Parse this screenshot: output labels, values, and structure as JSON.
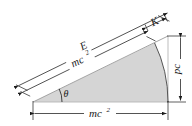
{
  "figure": {
    "background_color": "#ffffff",
    "fill_color": "#d5d5d5",
    "line_color": "#1a1a1a",
    "arc_color": "#555555"
  },
  "labels": {
    "total_energy": {
      "text": "E",
      "name": "total-energy-label"
    },
    "rest_energy_diagonal": {
      "base": "mc",
      "exponent": "2",
      "name": "rest-energy-diagonal-label"
    },
    "kinetic_energy": {
      "text": "K",
      "name": "kinetic-energy-label"
    },
    "momentum_term": {
      "text": "pc",
      "name": "momentum-term-label"
    },
    "rest_energy_base": {
      "base": "mc",
      "exponent": "2",
      "name": "rest-energy-base-label"
    },
    "angle": {
      "text": "θ",
      "name": "angle-theta-label"
    }
  },
  "geometry": {
    "apex": {
      "x": 33,
      "y": 102
    },
    "base_right": {
      "x": 168,
      "y": 102
    },
    "top_right": {
      "x": 168,
      "y": 36
    },
    "arc_radius_px": 135,
    "angle_degrees": 26
  },
  "dimensions": [
    {
      "name": "E",
      "orientation": "diagonal-outer",
      "measures": "total energy"
    },
    {
      "name": "mc^2",
      "orientation": "diagonal-inner",
      "measures": "rest energy"
    },
    {
      "name": "K",
      "orientation": "diagonal-segment",
      "measures": "kinetic energy"
    },
    {
      "name": "pc",
      "orientation": "vertical-right",
      "measures": "momentum times c"
    },
    {
      "name": "mc^2",
      "orientation": "horizontal-bottom",
      "measures": "rest energy"
    }
  ]
}
